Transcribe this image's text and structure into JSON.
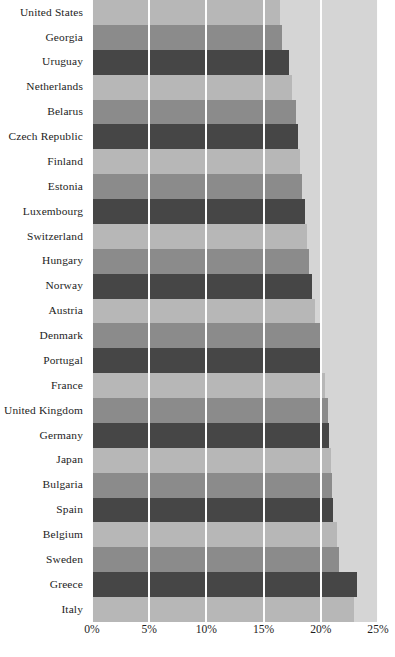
{
  "chart_data": {
    "type": "bar",
    "orientation": "horizontal",
    "title": "",
    "subtitle": "",
    "xlabel": "",
    "ylabel": "",
    "xlim": [
      0,
      25
    ],
    "grid": true,
    "legend": null,
    "legend_position": "none",
    "x_tick_labels": [
      "0%",
      "5%",
      "10%",
      "15%",
      "20%",
      "25%"
    ],
    "x_tick_values": [
      0,
      5,
      10,
      15,
      20,
      25
    ],
    "unit": "%",
    "bar_colors": [
      "#b7b7b7",
      "#8b8b8b",
      "#464646"
    ],
    "panel_background": "#d5d5d5",
    "gridline_color": "#fdfdfd",
    "categories": [
      "United States",
      "Georgia",
      "Uruguay",
      "Netherlands",
      "Belarus",
      "Czech Republic",
      "Finland",
      "Estonia",
      "Luxembourg",
      "Switzerland",
      "Hungary",
      "Norway",
      "Austria",
      "Denmark",
      "Portugal",
      "France",
      "United Kingdom",
      "Germany",
      "Japan",
      "Bulgaria",
      "Spain",
      "Belgium",
      "Sweden",
      "Greece",
      "Italy"
    ],
    "values": [
      16.4,
      16.6,
      17.2,
      17.5,
      17.8,
      18.0,
      18.2,
      18.4,
      18.6,
      18.8,
      19.0,
      19.2,
      19.5,
      20.0,
      20.1,
      20.4,
      20.6,
      20.7,
      20.9,
      21.0,
      21.1,
      21.4,
      21.6,
      23.2,
      22.9
    ],
    "caption": ""
  }
}
